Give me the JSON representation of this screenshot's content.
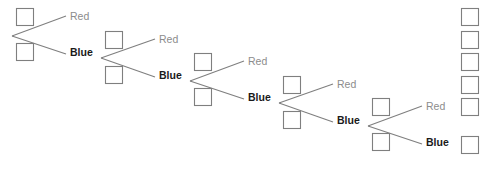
{
  "diagram": {
    "background_color": "#ffffff",
    "stroke_color": "#7f7f7f",
    "red_label_color": "#8c8c8c",
    "blue_label_color": "#1a1a1a",
    "box": {
      "width": 17,
      "height": 17
    },
    "stage_offset": {
      "x": 89,
      "y": 22.6
    },
    "stages": [
      {
        "index": 1,
        "vertex": {
          "x": 12,
          "y": 36
        },
        "top_box": {
          "x": 16,
          "y": 8
        },
        "bottom_box": {
          "x": 16,
          "y": 43
        },
        "red_label": "Red",
        "red_label_pos": {
          "x": 70,
          "y": 20
        },
        "red_line_end": {
          "x": 66,
          "y": 16
        },
        "blue_label": "Blue",
        "blue_label_pos": {
          "x": 70,
          "y": 56
        },
        "blue_line_end": {
          "x": 66,
          "y": 54
        }
      },
      {
        "index": 2,
        "vertex": {
          "x": 101,
          "y": 58
        },
        "top_box": {
          "x": 105,
          "y": 31
        },
        "bottom_box": {
          "x": 105,
          "y": 66
        },
        "red_label": "Red",
        "red_label_pos": {
          "x": 159,
          "y": 43
        },
        "red_line_end": {
          "x": 155,
          "y": 39
        },
        "blue_label": "Blue",
        "blue_label_pos": {
          "x": 159,
          "y": 79
        },
        "blue_line_end": {
          "x": 155,
          "y": 77
        }
      },
      {
        "index": 3,
        "vertex": {
          "x": 190,
          "y": 81
        },
        "top_box": {
          "x": 194,
          "y": 53
        },
        "bottom_box": {
          "x": 194,
          "y": 88
        },
        "red_label": "Red",
        "red_label_pos": {
          "x": 248,
          "y": 65
        },
        "red_line_end": {
          "x": 244,
          "y": 61
        },
        "blue_label": "Blue",
        "blue_label_pos": {
          "x": 248,
          "y": 101
        },
        "blue_line_end": {
          "x": 244,
          "y": 99
        }
      },
      {
        "index": 4,
        "vertex": {
          "x": 279,
          "y": 103
        },
        "top_box": {
          "x": 283,
          "y": 76
        },
        "bottom_box": {
          "x": 283,
          "y": 111
        },
        "red_label": "Red",
        "red_label_pos": {
          "x": 337,
          "y": 88
        },
        "red_line_end": {
          "x": 333,
          "y": 84
        },
        "blue_label": "Blue",
        "blue_label_pos": {
          "x": 337,
          "y": 124
        },
        "blue_line_end": {
          "x": 333,
          "y": 122
        }
      },
      {
        "index": 5,
        "vertex": {
          "x": 368,
          "y": 126
        },
        "top_box": {
          "x": 372,
          "y": 98
        },
        "bottom_box": {
          "x": 372,
          "y": 133
        },
        "red_label": "Red",
        "red_label_pos": {
          "x": 426,
          "y": 110
        },
        "red_line_end": {
          "x": 422,
          "y": 106
        },
        "blue_label": "Blue",
        "blue_label_pos": {
          "x": 426,
          "y": 146
        },
        "blue_line_end": {
          "x": 422,
          "y": 144
        }
      }
    ],
    "result_column": {
      "label": "outcome-boxes",
      "count": 6,
      "x": 461,
      "boxes_y": [
        8,
        31,
        53,
        76,
        98,
        136
      ]
    }
  }
}
